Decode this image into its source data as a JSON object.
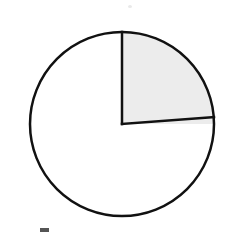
{
  "figure": {
    "title": "",
    "background_color": "#ffffff",
    "width": 225,
    "height": 235,
    "caption": ""
  },
  "chart_data": {
    "type": "pie",
    "title": "",
    "subtitle": "",
    "xlabel": "",
    "ylabel": "",
    "grid": false,
    "legend_position": "none",
    "center": {
      "x": 122,
      "y": 124
    },
    "radius": 92,
    "start_angle_deg": 90,
    "direction": "clockwise",
    "categories": [
      "Shaded quarter",
      "Unshaded remainder"
    ],
    "values": [
      25,
      75
    ],
    "labels": [
      "1/4",
      "3/4"
    ],
    "colors": [
      "#ececec",
      "#ffffff"
    ],
    "stroke_color": "#111111",
    "stroke_width": 2.5,
    "slices": [
      {
        "name": "Shaded quarter",
        "value": 25,
        "fraction": 0.25,
        "angle_deg": 90,
        "start_angle_deg": 90,
        "end_angle_deg": 0,
        "fill": "#ececec",
        "label": "1/4",
        "shaded": true
      },
      {
        "name": "Unshaded remainder",
        "value": 75,
        "fraction": 0.75,
        "angle_deg": 270,
        "start_angle_deg": 0,
        "end_angle_deg": 90,
        "fill": "#ffffff",
        "label": "3/4",
        "shaded": false
      }
    ],
    "annotations": []
  },
  "marks": {
    "top_speck": "scan-speck",
    "bottom_speck": "scan-speck"
  }
}
